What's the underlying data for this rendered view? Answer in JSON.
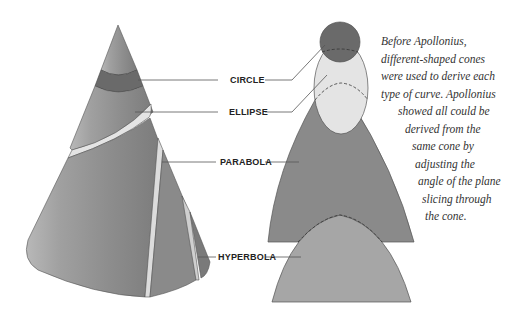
{
  "labels": {
    "circle": "CIRCLE",
    "ellipse": "ELLIPSE",
    "parabola": "PARABOLA",
    "hyperbola": "HYPERBOLA"
  },
  "caption": {
    "lines": [
      "Before Apollonius,",
      "different-shaped cones",
      "were used to derive each",
      "type of curve. Apollonius",
      "showed all could be",
      "derived from the",
      "same cone by",
      "adjusting the",
      "angle of the plane",
      "slicing through",
      "the cone."
    ]
  },
  "colors": {
    "cone": "#8f8f8f",
    "circle": "#6a6a6a",
    "ellipse": "#e4e4e4",
    "parabola": "#8a8a8a",
    "hyperbola": "#a6a6a6",
    "leader": "#555555"
  }
}
